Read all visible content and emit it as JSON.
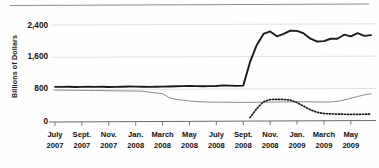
{
  "figure": {
    "has_top_rule": true,
    "background": "#fefefe"
  },
  "chart_data": {
    "type": "line",
    "title": "",
    "xlabel": "",
    "ylabel": "Billions of Dollars",
    "ylim": [
      0,
      2600
    ],
    "yticks": [
      0,
      800,
      1600,
      2400
    ],
    "ytick_labels": [
      "0",
      "800",
      "1,600",
      "2,400"
    ],
    "grid": true,
    "grid_axis": "y",
    "legend": "none",
    "xlim": [
      "2007-07",
      "2009-06"
    ],
    "categories": [
      "July 2007",
      "Sept. 2007",
      "Nov. 2007",
      "Jan. 2008",
      "March 2008",
      "May 2008",
      "July 2008",
      "Sept. 2008",
      "Nov. 2008",
      "Jan. 2009",
      "March 2009",
      "May 2009"
    ],
    "xtick_labels": [
      {
        "month": "July",
        "year": "2007"
      },
      {
        "month": "Sept.",
        "year": "2007"
      },
      {
        "month": "Nov.",
        "year": "2007"
      },
      {
        "month": "Jan.",
        "year": "2008"
      },
      {
        "month": "March",
        "year": "2008"
      },
      {
        "month": "May",
        "year": "2008"
      },
      {
        "month": "July",
        "year": "2008"
      },
      {
        "month": "Sept.",
        "year": "2008"
      },
      {
        "month": "Nov.",
        "year": "2008"
      },
      {
        "month": "Jan.",
        "year": "2009"
      },
      {
        "month": "March",
        "year": "2009"
      },
      {
        "month": "May",
        "year": "2009"
      }
    ],
    "series": [
      {
        "name": "total-assets",
        "style": "solid-thick",
        "color": "#1b1b1b",
        "x": [
          0,
          1,
          2,
          3,
          4,
          5,
          6,
          7,
          8,
          9,
          10,
          11,
          12,
          13,
          14,
          15,
          16,
          17,
          18,
          19,
          20,
          21,
          22,
          23,
          24,
          25,
          26,
          27,
          28,
          29,
          30,
          31,
          32,
          33,
          34,
          35,
          36,
          37,
          38,
          39,
          40,
          41,
          42,
          43,
          44,
          45,
          46,
          47
        ],
        "values": [
          870,
          868,
          872,
          866,
          870,
          874,
          868,
          872,
          866,
          870,
          874,
          880,
          876,
          872,
          868,
          872,
          876,
          880,
          884,
          888,
          892,
          888,
          884,
          888,
          892,
          905,
          900,
          895,
          900,
          1480,
          1900,
          2180,
          2240,
          2120,
          2180,
          2260,
          2255,
          2190,
          2060,
          1990,
          2000,
          2060,
          2060,
          2160,
          2120,
          2200,
          2130,
          2150
        ]
      },
      {
        "name": "securities-held-outright",
        "style": "solid-thin",
        "color": "#8a8a8a",
        "x": [
          0,
          1,
          2,
          3,
          4,
          5,
          6,
          7,
          8,
          9,
          10,
          11,
          12,
          13,
          14,
          15,
          16,
          17,
          18,
          19,
          20,
          21,
          22,
          23,
          24,
          25,
          26,
          27,
          28,
          29,
          30,
          31,
          32,
          33,
          34,
          35,
          36,
          37,
          38,
          39,
          40,
          41,
          42,
          43,
          44,
          45,
          46,
          47
        ],
        "values": [
          790,
          788,
          786,
          784,
          782,
          780,
          778,
          776,
          774,
          772,
          770,
          768,
          766,
          762,
          740,
          718,
          700,
          600,
          560,
          540,
          520,
          505,
          498,
          492,
          490,
          490,
          488,
          486,
          486,
          486,
          488,
          490,
          492,
          494,
          496,
          498,
          500,
          500,
          498,
          496,
          494,
          496,
          510,
          545,
          590,
          630,
          670,
          700
        ]
      },
      {
        "name": "liquidity-facilities",
        "style": "dotted",
        "color": "#1b1b1b",
        "x": [
          29,
          30,
          31,
          32,
          33,
          34,
          35,
          36,
          37,
          38,
          39,
          40,
          41,
          42,
          43,
          44,
          45,
          46,
          47
        ],
        "values": [
          110,
          330,
          500,
          555,
          560,
          558,
          540,
          480,
          390,
          300,
          240,
          210,
          200,
          195,
          192,
          190,
          190,
          192,
          195
        ]
      }
    ]
  },
  "axes": {
    "ylabel": "Billions of Dollars",
    "ytick_labels": [
      "2,400",
      "1,600",
      "800",
      "0"
    ]
  }
}
